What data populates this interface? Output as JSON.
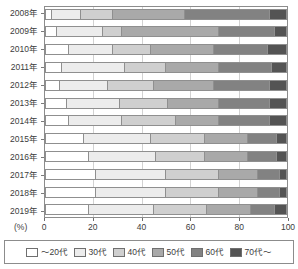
{
  "chart_data": {
    "type": "bar",
    "orientation": "horizontal",
    "stacked": true,
    "stack_total": 100,
    "title": "",
    "subtitle": "",
    "xlabel": "(%)",
    "ylabel": "",
    "xlim": [
      0,
      100
    ],
    "xticks": [
      0,
      20,
      40,
      60,
      80,
      100
    ],
    "xtick_labels": [
      "0",
      "20",
      "40",
      "60",
      "80",
      "100"
    ],
    "grid": true,
    "grid_axis": "x",
    "legend_position": "bottom",
    "categories": [
      "2008年",
      "2009年",
      "2010年",
      "2011年",
      "2012年",
      "2013年",
      "2014年",
      "2015年",
      "2016年",
      "2017年",
      "2018年",
      "2019年"
    ],
    "series": [
      {
        "name": "～20代",
        "color": "#ffffff",
        "values": [
          3,
          5,
          10,
          7,
          6,
          9,
          10,
          16,
          18,
          21,
          21,
          18
        ]
      },
      {
        "name": "30代",
        "color": "#ececec",
        "values": [
          12,
          19,
          18,
          26,
          20,
          22,
          22,
          28,
          28,
          29,
          29,
          27
        ]
      },
      {
        "name": "40代",
        "color": "#cfcfcf",
        "values": [
          13,
          8,
          16,
          17,
          19,
          20,
          22,
          22,
          20,
          22,
          22,
          22
        ]
      },
      {
        "name": "50代",
        "color": "#a9a9a9",
        "values": [
          30,
          40,
          26,
          22,
          25,
          21,
          18,
          18,
          18,
          16,
          16,
          18
        ]
      },
      {
        "name": "60代",
        "color": "#828282",
        "values": [
          35,
          23,
          22,
          22,
          23,
          21,
          21,
          12,
          12,
          9,
          9,
          10
        ]
      },
      {
        "name": "70代～",
        "color": "#545454",
        "values": [
          7,
          5,
          8,
          6,
          7,
          7,
          7,
          4,
          4,
          3,
          3,
          5
        ]
      }
    ]
  },
  "legend": {
    "items": [
      {
        "label": "～20代",
        "color": "#ffffff"
      },
      {
        "label": "30代",
        "color": "#ececec"
      },
      {
        "label": "40代",
        "color": "#cfcfcf"
      },
      {
        "label": "50代",
        "color": "#a9a9a9"
      },
      {
        "label": "60代",
        "color": "#828282"
      },
      {
        "label": "70代～",
        "color": "#545454"
      }
    ]
  },
  "axis": {
    "unit_label": "(%)"
  }
}
